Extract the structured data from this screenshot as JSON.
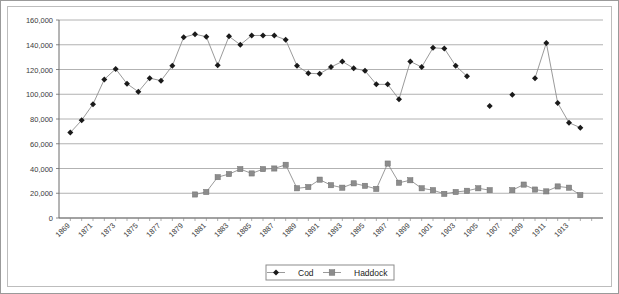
{
  "chart_data": {
    "type": "line",
    "title": "",
    "subtitle": "",
    "xlabel": "",
    "ylabel": "",
    "ylim": [
      0,
      160000
    ],
    "ytick_values": [
      0,
      20000,
      40000,
      60000,
      80000,
      100000,
      120000,
      140000,
      160000
    ],
    "ytick_labels": [
      "0",
      "20,000",
      "40,000",
      "60,000",
      "80,000",
      "100,000",
      "120,000",
      "140,000",
      "160,000"
    ],
    "grid": true,
    "grid_axis": "y",
    "legend_position": "bottom-center",
    "x": [
      1869,
      1870,
      1871,
      1872,
      1873,
      1874,
      1875,
      1876,
      1877,
      1878,
      1879,
      1880,
      1881,
      1882,
      1883,
      1884,
      1885,
      1886,
      1887,
      1888,
      1889,
      1890,
      1891,
      1892,
      1893,
      1894,
      1895,
      1896,
      1897,
      1898,
      1899,
      1900,
      1901,
      1902,
      1903,
      1904,
      1905,
      1906,
      1907,
      1908,
      1909,
      1910,
      1911,
      1912,
      1913,
      1914,
      1915
    ],
    "xtick_labels": [
      "1869",
      "1871",
      "1873",
      "1875",
      "1877",
      "1879",
      "1881",
      "1883",
      "1885",
      "1887",
      "1889",
      "1891",
      "1893",
      "1895",
      "1897",
      "1899",
      "1901",
      "1903",
      "1905",
      "1907",
      "1909",
      "1911",
      "1913"
    ],
    "xtick_values": [
      1869,
      1871,
      1873,
      1875,
      1877,
      1879,
      1881,
      1883,
      1885,
      1887,
      1889,
      1891,
      1893,
      1895,
      1897,
      1899,
      1901,
      1903,
      1905,
      1907,
      1909,
      1911,
      1913
    ],
    "xlim": [
      1868,
      1916
    ],
    "series": [
      {
        "name": "Cod",
        "marker": "diamond",
        "color": "#1a1a1a",
        "line_color": "#8f8f8f",
        "values": [
          69000,
          79000,
          92000,
          112000,
          120500,
          108500,
          102000,
          113000,
          111000,
          123000,
          146000,
          148500,
          146500,
          123500,
          146800,
          140000,
          147500,
          147500,
          147500,
          144000,
          123000,
          117000,
          116500,
          122000,
          126500,
          121000,
          119000,
          108000,
          108000,
          96000,
          126500,
          122000,
          137500,
          137000,
          123000,
          114500,
          null,
          90500,
          null,
          99500,
          null,
          113000,
          141500,
          93000,
          77000,
          73000,
          null
        ]
      },
      {
        "name": "Haddock",
        "marker": "square",
        "color": "#8c8c8c",
        "line_color": "#8f8f8f",
        "values": [
          null,
          null,
          null,
          null,
          null,
          null,
          null,
          null,
          null,
          null,
          null,
          19000,
          21000,
          33000,
          35500,
          39500,
          36000,
          39500,
          40000,
          43000,
          24000,
          25000,
          31000,
          26500,
          24500,
          28000,
          26000,
          23500,
          44000,
          28500,
          30500,
          24000,
          22500,
          19500,
          21000,
          22000,
          24000,
          22500,
          null,
          22500,
          27000,
          23000,
          21500,
          25500,
          24500,
          18500,
          null
        ]
      }
    ]
  },
  "legend": {
    "items": [
      {
        "label": "Cod",
        "marker": "diamond"
      },
      {
        "label": "Haddock",
        "marker": "square"
      }
    ]
  }
}
